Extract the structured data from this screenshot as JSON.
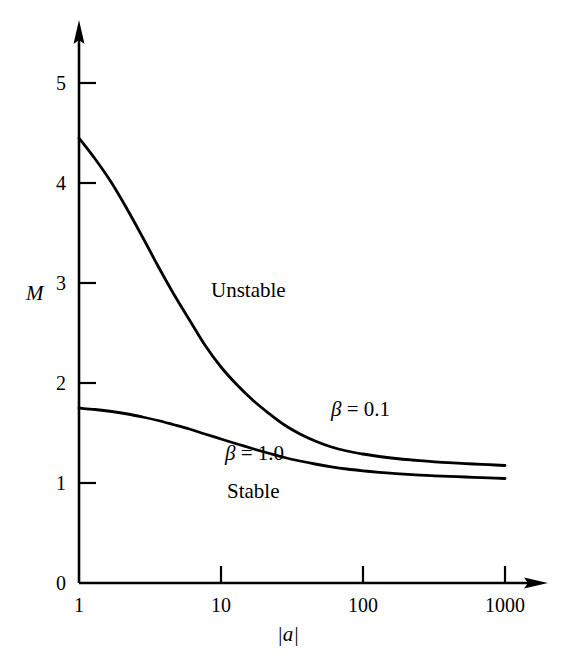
{
  "chart_data": {
    "type": "line",
    "title": "",
    "xlabel": "|a|",
    "ylabel": "M",
    "xscale": "log",
    "xlim": [
      1,
      1000
    ],
    "ylim": [
      0,
      5
    ],
    "xticks": [
      1,
      10,
      100,
      1000
    ],
    "xtick_labels": [
      "1",
      "10",
      "100",
      "1000"
    ],
    "yticks": [
      0,
      1,
      2,
      3,
      4,
      5
    ],
    "ytick_labels": [
      "0",
      "1",
      "2",
      "3",
      "4",
      "5"
    ],
    "grid": false,
    "legend_position": "inline-annotations",
    "axis_color": "#000000",
    "curve_color": "#000000",
    "background_color": "#ffffff",
    "annotations": [
      {
        "text": "Unstable",
        "x": 30,
        "y": 3.0
      },
      {
        "text": "Stable",
        "x": 30,
        "y": 0.62
      }
    ],
    "series": [
      {
        "name": "β = 0.1",
        "label_beta": "β",
        "label_eq": "=",
        "label_value": "0.1",
        "label_x": 150,
        "label_y": 1.62,
        "x": [
          1,
          1.3,
          1.7,
          2.2,
          2.8,
          3.6,
          4.6,
          6,
          7.7,
          10,
          13,
          17,
          22,
          28,
          36,
          46,
          60,
          77,
          100,
          130,
          170,
          220,
          280,
          360,
          460,
          600,
          770,
          1000
        ],
        "y": [
          4.45,
          4.24,
          4.0,
          3.73,
          3.46,
          3.17,
          2.9,
          2.63,
          2.38,
          2.16,
          1.98,
          1.82,
          1.69,
          1.58,
          1.49,
          1.42,
          1.36,
          1.32,
          1.29,
          1.265,
          1.245,
          1.23,
          1.218,
          1.207,
          1.198,
          1.19,
          1.183,
          1.175
        ]
      },
      {
        "name": "β = 1.0",
        "label_beta": "β",
        "label_eq": "=",
        "label_value": "1.0",
        "label_x": 54,
        "label_y": 1.02,
        "x": [
          1,
          1.3,
          1.7,
          2.2,
          2.8,
          3.6,
          4.6,
          6,
          7.7,
          10,
          13,
          17,
          22,
          28,
          36,
          46,
          60,
          77,
          100,
          130,
          170,
          220,
          280,
          360,
          460,
          600,
          770,
          1000
        ],
        "y": [
          1.75,
          1.735,
          1.715,
          1.69,
          1.66,
          1.625,
          1.585,
          1.54,
          1.49,
          1.44,
          1.39,
          1.34,
          1.295,
          1.255,
          1.22,
          1.19,
          1.162,
          1.14,
          1.122,
          1.107,
          1.094,
          1.084,
          1.076,
          1.069,
          1.063,
          1.057,
          1.052,
          1.045
        ]
      }
    ]
  },
  "axis": {
    "y_title": "M",
    "x_title_core": "a",
    "x_title_bar": "|",
    "x_title_full": "|a|"
  },
  "regions": {
    "unstable": "Unstable",
    "stable": "Stable"
  },
  "icons": {
    "y_axis_arrow": "y-axis-arrow-icon",
    "x_axis_arrow": "x-axis-arrow-icon"
  }
}
